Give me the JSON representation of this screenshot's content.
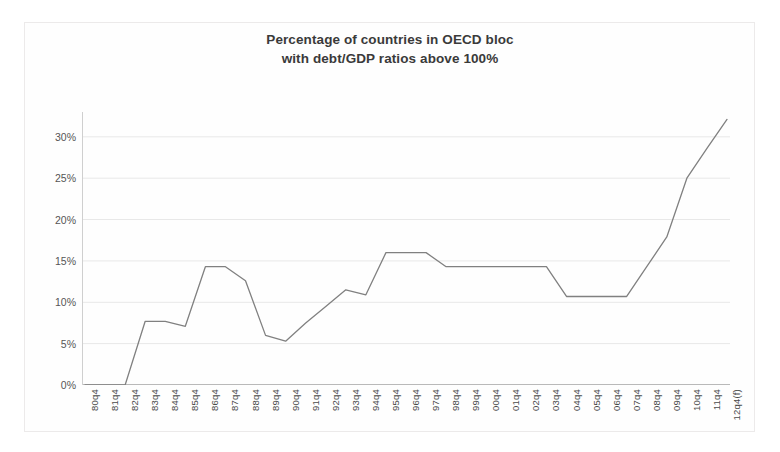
{
  "chart_data": {
    "type": "line",
    "title": "Percentage of countries in OECD bloc\nwith debt/GDP ratios above 100%",
    "xlabel": "",
    "ylabel": "",
    "ylim": [
      0,
      33
    ],
    "yticks": [
      0,
      5,
      10,
      15,
      20,
      25,
      30
    ],
    "ytick_labels": [
      "0%",
      "5%",
      "10%",
      "15%",
      "20%",
      "25%",
      "30%"
    ],
    "grid": true,
    "legend": "none",
    "line_color": "#808080",
    "categories": [
      "80q4",
      "81q4",
      "82q4",
      "83q4",
      "84q4",
      "85q4",
      "86q4",
      "87q4",
      "88q4",
      "89q4",
      "90q4",
      "91q4",
      "92q4",
      "93q4",
      "94q4",
      "95q4",
      "96q4",
      "97q4",
      "98q4",
      "99q4",
      "00q4",
      "01q4",
      "02q4",
      "03q4",
      "04q4",
      "05q4",
      "06q4",
      "07q4",
      "08q4",
      "09q4",
      "10q4",
      "11q4",
      "12q4(f)"
    ],
    "values": [
      0.0,
      0.0,
      0.0,
      7.7,
      7.7,
      7.1,
      14.3,
      14.3,
      12.6,
      6.0,
      5.3,
      7.5,
      9.5,
      11.5,
      10.9,
      16.0,
      16.0,
      16.0,
      14.3,
      14.3,
      14.3,
      14.3,
      14.3,
      14.3,
      10.7,
      10.7,
      10.7,
      10.7,
      14.3,
      17.9,
      25.0,
      28.6,
      32.1
    ]
  },
  "chart": {
    "title_line1": "Percentage of countries in OECD bloc",
    "title_line2": "with debt/GDP ratios above 100%"
  }
}
